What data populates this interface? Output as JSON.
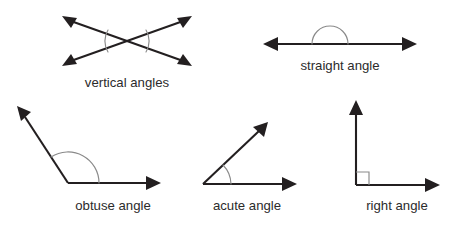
{
  "figure": {
    "background_color": "#ffffff",
    "line_color": "#231f20",
    "arc_color": "#8a8a8a",
    "text_color": "#2b2b2b"
  },
  "diagrams": [
    {
      "id": "vertical-angles",
      "label": "vertical angles",
      "label_x": 127,
      "label_y": 87,
      "arc_marks": 2,
      "icon": "crossed-lines-icon"
    },
    {
      "id": "straight-angle",
      "label": "straight angle",
      "label_x": 340,
      "label_y": 70,
      "arc_marks": 1,
      "icon": "straight-line-icon"
    },
    {
      "id": "obtuse-angle",
      "label": "obtuse angle",
      "label_x": 113,
      "label_y": 210,
      "arc_marks": 1,
      "icon": "obtuse-angle-icon"
    },
    {
      "id": "acute-angle",
      "label": "acute angle",
      "label_x": 247,
      "label_y": 210,
      "arc_marks": 1,
      "icon": "acute-angle-icon"
    },
    {
      "id": "right-angle",
      "label": "right angle",
      "label_x": 397,
      "label_y": 210,
      "arc_marks": 0,
      "icon": "right-angle-square-icon"
    }
  ]
}
